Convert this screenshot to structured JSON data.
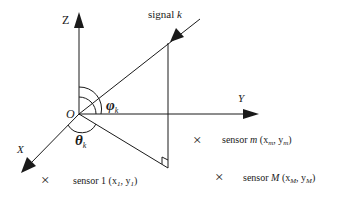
{
  "diagram": {
    "type": "3D coordinate system with signal arrival angles",
    "origin": {
      "label": "O"
    },
    "axes": {
      "z": {
        "label": "Z"
      },
      "y": {
        "label": "Y"
      },
      "x": {
        "label": "X"
      }
    },
    "signal": {
      "label_text": "signal ",
      "label_index": "k"
    },
    "angles": {
      "elevation": {
        "symbol": "φ",
        "subscript": "k"
      },
      "azimuth": {
        "symbol": "θ",
        "subscript": "k"
      }
    },
    "sensors": [
      {
        "marker": "×",
        "name": "sensor 1",
        "coords_text": "(x",
        "sub1": "1",
        "sep": ", y",
        "sub2": "1",
        "close": ")"
      },
      {
        "marker": "×",
        "name": "sensor ",
        "name_index": "m",
        "coords_text": "(x",
        "sub1": "m",
        "sep": ", y",
        "sub2": "m",
        "close": ")"
      },
      {
        "marker": "×",
        "name": "sensor ",
        "name_index": "M",
        "coords_text": "(x",
        "sub1": "M",
        "sep": ", y",
        "sub2": "M",
        "close": ")"
      }
    ],
    "colors": {
      "stroke": "#1a1a1a",
      "background": "#ffffff"
    }
  }
}
